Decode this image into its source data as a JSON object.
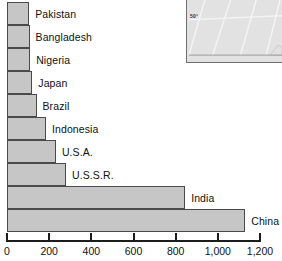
{
  "chart_data": {
    "type": "bar",
    "orientation": "horizontal",
    "title": "",
    "xlabel": "",
    "ylabel": "",
    "xlim": [
      0,
      1200
    ],
    "xticks": [
      0,
      200,
      400,
      600,
      800,
      1000,
      1200
    ],
    "xtick_labels": [
      "0",
      "200",
      "400",
      "600",
      "800",
      "1,000",
      "1,200"
    ],
    "grid": false,
    "legend": false,
    "categories": [
      "Pakistan",
      "Bangladesh",
      "Nigeria",
      "Japan",
      "Brazil",
      "Indonesia",
      "U.S.A.",
      "U.S.S.R.",
      "India",
      "China"
    ],
    "values": [
      105,
      107,
      110,
      120,
      140,
      185,
      232,
      280,
      845,
      1130
    ],
    "bars": [
      {
        "label": "Pakistan",
        "value": 105
      },
      {
        "label": "Bangladesh",
        "value": 107
      },
      {
        "label": "Nigeria",
        "value": 110
      },
      {
        "label": "Japan",
        "value": 120
      },
      {
        "label": "Brazil",
        "value": 140
      },
      {
        "label": "Indonesia",
        "value": 185
      },
      {
        "label": "U.S.A.",
        "value": 232
      },
      {
        "label": "U.S.S.R.",
        "value": 280
      },
      {
        "label": "India",
        "value": 845
      },
      {
        "label": "China",
        "value": 1130
      }
    ]
  },
  "colors": {
    "bar_fill": "#c6c6c6",
    "bar_border": "#4a4a4a",
    "axis": "#1c1c1c",
    "text": "#111111",
    "inset_fill": "#e2e2e2",
    "inset_border": "#6f6f6f"
  },
  "inset_map": {
    "latitude_label": "50°"
  }
}
